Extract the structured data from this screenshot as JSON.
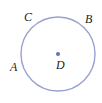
{
  "figure": {
    "kind": "circle-geometry-diagram",
    "background_color": "#ffffff",
    "circle": {
      "name": "circle-D",
      "center_label": "D",
      "center_x": 58,
      "center_y": 54,
      "radius": 37,
      "stroke_color": "#9aa0d0",
      "stroke_width": 1.4,
      "fill": "none"
    },
    "center_point": {
      "name": "point-D",
      "x": 58,
      "y": 54,
      "radius": 2,
      "color": "#6a6fb0"
    },
    "labels": {
      "a": "A",
      "b": "B",
      "c": "C",
      "d": "D"
    },
    "label_color": "#1d1d1d",
    "points_on_circle": [
      {
        "label": "A",
        "x": 22,
        "y": 73
      },
      {
        "label": "B",
        "x": 85,
        "y": 27
      },
      {
        "label": "C",
        "x": 36,
        "y": 21
      }
    ]
  }
}
